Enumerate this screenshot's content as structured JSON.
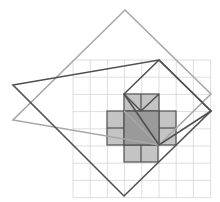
{
  "diagram": {
    "title": "",
    "grid": {
      "x0": 73,
      "y0": 60,
      "cell": 17.2,
      "cols": 8,
      "rows": 8,
      "color": "#d6d6d6"
    },
    "colors": {
      "light_fill": "#c4c4c4",
      "dark_fill": "#9a9a9a",
      "outline": "#505050",
      "light_outline": "#a8a8a8"
    }
  }
}
